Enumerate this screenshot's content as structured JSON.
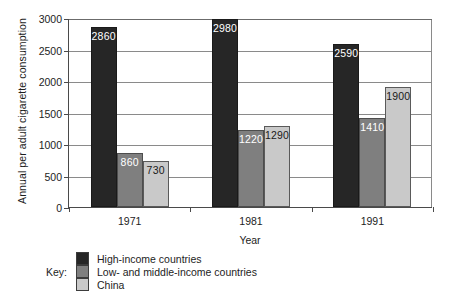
{
  "chart_data": {
    "type": "bar",
    "title": "",
    "xlabel": "Year",
    "ylabel": "Annual per adult cigarette consumption",
    "categories": [
      "1971",
      "1981",
      "1991"
    ],
    "series": [
      {
        "name": "High-income countries",
        "color": "#262626",
        "values": [
          2860,
          2980,
          2590
        ]
      },
      {
        "name": "Low- and middle-income countries",
        "color": "#7f7f7f",
        "values": [
          860,
          1220,
          1410
        ]
      },
      {
        "name": "China",
        "color": "#c9c9c9",
        "values": [
          730,
          1290,
          1900
        ]
      }
    ],
    "ylim": [
      0,
      3000
    ],
    "yticks": [
      0,
      500,
      1000,
      1500,
      2000,
      2500,
      3000
    ],
    "ytick_labels": [
      "0",
      "500",
      "1000",
      "1500",
      "2000",
      "2500",
      "3000"
    ],
    "grid": true,
    "grid_axis": "y",
    "legend_position": "bottom",
    "legend_prefix": "Key:",
    "data_labels": true
  }
}
